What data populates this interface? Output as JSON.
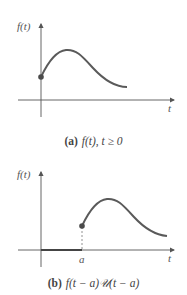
{
  "figures": [
    {
      "id": "a",
      "y_axis_label": "f(t)",
      "x_axis_label": "t",
      "caption_tag": "(a)",
      "caption_text": "f(t), t ≥ 0"
    },
    {
      "id": "b",
      "y_axis_label": "f(t)",
      "x_axis_label": "t",
      "shift_label": "a",
      "caption_tag": "(b)",
      "caption_text": "f(t − a)𝒰(t − a)"
    }
  ],
  "colors": {
    "axis": "#555555",
    "curve": "#5a5a5a",
    "point": "#4a4a4a",
    "text": "#444444"
  }
}
